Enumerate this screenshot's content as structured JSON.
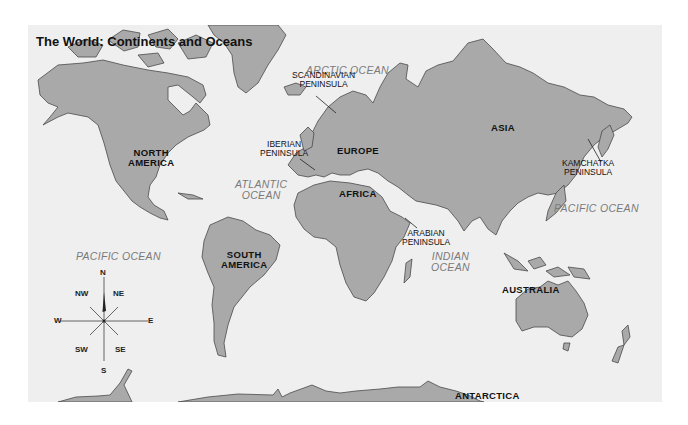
{
  "map": {
    "title": "The World: Continents and Oceans",
    "colors": {
      "land": "#a9a9a9",
      "ocean": "#efefef",
      "outline": "#4a4a4a",
      "ocean_label": "#7a7a7a"
    },
    "continents": {
      "north_america": "NORTH\nAMERICA",
      "north_america_l1": "NORTH",
      "north_america_l2": "AMERICA",
      "south_america_l1": "SOUTH",
      "south_america_l2": "AMERICA",
      "europe": "EUROPE",
      "africa": "AFRICA",
      "asia": "ASIA",
      "australia": "AUSTRALIA",
      "antarctica": "ANTARCTICA"
    },
    "oceans": {
      "arctic": "ARCTIC OCEAN",
      "atlantic_l1": "ATLANTIC",
      "atlantic_l2": "OCEAN",
      "pacific_west": "PACIFIC OCEAN",
      "pacific_east": "PACIFIC OCEAN",
      "indian_l1": "INDIAN",
      "indian_l2": "OCEAN"
    },
    "peninsulas": {
      "scandinavian_l1": "SCANDINAVIAN",
      "scandinavian_l2": "PENINSULA",
      "iberian_l1": "IBERIAN",
      "iberian_l2": "PENINSULA",
      "arabian_l1": "ARABIAN",
      "arabian_l2": "PENINSULA",
      "kamchatka_l1": "KAMCHATKA",
      "kamchatka_l2": "PENINSULA"
    },
    "compass": {
      "n": "N",
      "ne": "NE",
      "e": "E",
      "se": "SE",
      "s": "S",
      "sw": "SW",
      "w": "W",
      "nw": "NW"
    }
  }
}
